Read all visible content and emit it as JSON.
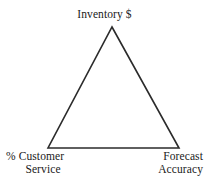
{
  "diagram": {
    "type": "triangle-tradeoff-diagram",
    "background_color": "#ffffff",
    "stroke_color": "#2b2b2b",
    "stroke_width": 1.6,
    "vertices": [
      {
        "id": "apex",
        "x": 112,
        "y": 27
      },
      {
        "id": "bottom-left",
        "x": 48,
        "y": 148
      },
      {
        "id": "bottom-right",
        "x": 179,
        "y": 148
      }
    ],
    "labels": {
      "apex": {
        "text": "Inventory $"
      },
      "bottom_left": {
        "line_1": "% Customer",
        "line_2": "Service"
      },
      "bottom_right": {
        "line_1": "Forecast",
        "line_2": "Accuracy"
      }
    }
  }
}
